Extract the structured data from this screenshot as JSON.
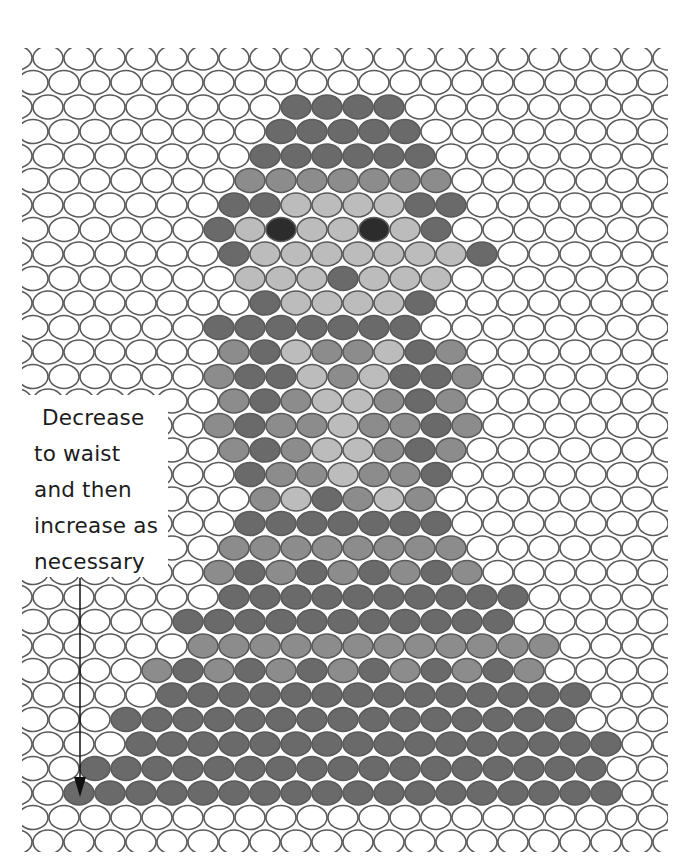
{
  "diagram": {
    "type": "offset-stitch-chart",
    "grid": {
      "rows": 33,
      "row_pitch_px": 24.5,
      "col_pitch_px": 31,
      "cell_rx": 15,
      "cell_ry": 12,
      "first_row_y": 58,
      "even_row_x0": 48,
      "odd_row_x0": 33,
      "cols_per_row": 21,
      "outline_color": "#5a5a5a",
      "empty_fill": "#ffffff"
    },
    "palette": {
      ".": "#ffffff",
      "D": "#6a6a6a",
      "M": "#8c8c8c",
      "L": "#bcbcbc",
      "E": "#2c2c2c"
    },
    "legend_note": "Each row string: one character per cell, left to right. '.'=blank, D=dark, M=medium, L=light, E=eye",
    "rows": [
      ".....................",
      ".....................",
      "........DDDD.........",
      "........DDDDD........",
      ".......DDDDDD........",
      ".......MMMMMMM.......",
      "......DDLLLLDD.......",
      "......DLELLELD.......",
      "......DLLLLLLLD......",
      ".......LLLDLLL.......",
      ".......DLLLLD........",
      "......DDDDDDD........",
      "......MDLMMLDM.......",
      "......MDDLMLDDM......",
      "......MDMLLMDM.......",
      "......MDMMLMMDM......",
      "......MDMLLMDM.......",
      ".......DMMLMMD.......",
      ".......MLDMLM........",
      ".......DDDDDDD.......",
      "......MMMMMMMM.......",
      "......MDMDMDMDM......",
      "......DDDDDDDDDD.....",
      ".....DDDDDDDDDDD.....",
      ".....MMMMMMMMMMMM....",
      "....MDMDMDMDMDMDM....",
      "....DDDDDDDDDDDDDD...",
      "...DDDDDDDDDDDDDDD...",
      "...DDDDDDDDDDDDDDDD..",
      "..DDDDDDDDDDDDDDDDD..",
      ".DDDDDDDDDDDDDDDDDD..",
      ".....................",
      "....................."
    ],
    "annotation": {
      "lines": [
        "Decrease",
        "to waist",
        "and then",
        "increase as",
        "necessary"
      ],
      "arrow": {
        "x": 80,
        "y_start": 578,
        "y_end": 797,
        "direction": "down"
      }
    }
  }
}
